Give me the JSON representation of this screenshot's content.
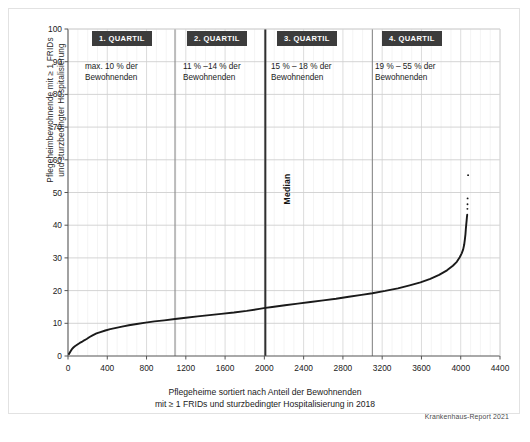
{
  "figure": {
    "credit": "Krankenhaus-Report 2021",
    "median_label": "Median"
  },
  "annotations": {
    "quartiles": [
      {
        "badge": "1. QUARTIL",
        "line1": "max. 10 % der",
        "line2": "Bewohnenden"
      },
      {
        "badge": "2. QUARTIL",
        "line1": "11 % –14 % der",
        "line2": "Bewohnenden"
      },
      {
        "badge": "3. QUARTIL",
        "line1": "15 % – 18 % der",
        "line2": "Bewohnenden"
      },
      {
        "badge": "4. QUARTIL",
        "line1": "19 % – 55 % der",
        "line2": "Bewohnenden"
      }
    ]
  },
  "chart_data": {
    "type": "line",
    "title": "",
    "xlabel_line1": "Pflegeheime sortiert nach Anteil der Bewohnenden",
    "xlabel_line2": "mit ≥ 1 FRIDs und sturzbedingter Hospitalisierung in 2018",
    "ylabel_line1": "Pflegeheimbewohnende mit ≥ 1 FRIDs",
    "ylabel_line2": "und sturzbedingter Hospitalisierung",
    "xlim": [
      0,
      4400
    ],
    "ylim": [
      0,
      100
    ],
    "xticks": [
      0,
      400,
      800,
      1200,
      1600,
      2000,
      2400,
      2800,
      3200,
      3600,
      4000,
      4400
    ],
    "yticks": [
      0,
      10,
      20,
      30,
      40,
      50,
      60,
      70,
      80,
      90,
      100
    ],
    "x_minor_step": 100,
    "grid": true,
    "legend": null,
    "series": [
      {
        "name": "Pflegeheime sortiert nach Anteil",
        "color": "#1a1a1a",
        "x": [
          10,
          25,
          40,
          55,
          70,
          85,
          100,
          120,
          140,
          165,
          190,
          220,
          250,
          290,
          330,
          380,
          430,
          490,
          550,
          620,
          700,
          790,
          880,
          980,
          1090,
          1200,
          1320,
          1440,
          1560,
          1690,
          1820,
          1950,
          2010,
          2080,
          2210,
          2340,
          2470,
          2600,
          2730,
          2860,
          2990,
          3100,
          3230,
          3360,
          3480,
          3590,
          3690,
          3780,
          3860,
          3920,
          3960,
          3990,
          4010,
          4025,
          4035,
          4042,
          4048,
          4052,
          4056,
          4060,
          4063,
          4066
        ],
        "y": [
          0.6,
          1.4,
          2.1,
          2.6,
          3.0,
          3.3,
          3.6,
          4.0,
          4.3,
          4.8,
          5.2,
          5.8,
          6.3,
          6.9,
          7.3,
          7.8,
          8.2,
          8.6,
          9.0,
          9.4,
          9.8,
          10.2,
          10.6,
          10.9,
          11.3,
          11.7,
          12.1,
          12.5,
          12.9,
          13.3,
          13.8,
          14.4,
          14.7,
          15.0,
          15.5,
          16.0,
          16.5,
          17.0,
          17.5,
          18.1,
          18.7,
          19.2,
          19.9,
          20.7,
          21.6,
          22.5,
          23.6,
          24.8,
          26.2,
          27.6,
          28.8,
          30.2,
          31.4,
          32.6,
          34.0,
          35.6,
          37.2,
          38.8,
          40.2,
          41.4,
          42.4,
          43.2
        ],
        "tail_dots": [
          {
            "x": 4068,
            "y": 45.0
          },
          {
            "x": 4069,
            "y": 46.4
          },
          {
            "x": 4070,
            "y": 48.2
          },
          {
            "x": 4075,
            "y": 55.3
          }
        ]
      }
    ],
    "median_x": 2010,
    "quartile_dividers": [
      1090,
      2010,
      3100
    ],
    "annotations_note": "Quartile bands delimited by vertical lines; median marked with a heavier vertical rule."
  }
}
